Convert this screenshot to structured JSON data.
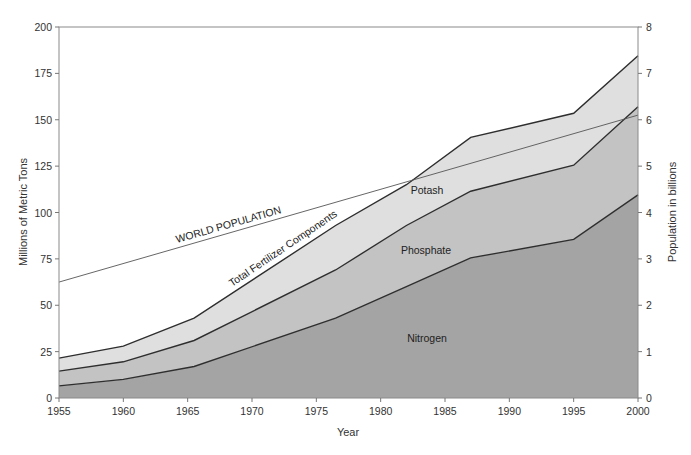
{
  "chart_data": {
    "type": "area",
    "stacked": true,
    "title": "",
    "xlabel": "Year",
    "ylabel": "Millions of Metric Tons",
    "ylabel_right": "Population in billions",
    "xlim": [
      1955,
      2000
    ],
    "ylim": [
      0,
      200
    ],
    "ylim_right": [
      0,
      8
    ],
    "grid": false,
    "legend": "none (inline annotations)",
    "x_ticks": [
      "1955",
      "1960",
      "1965",
      "1970",
      "1975",
      "1980",
      "1985",
      "1990",
      "1995",
      "2000"
    ],
    "y_ticks": [
      "0",
      "25",
      "50",
      "75",
      "100",
      "125",
      "150",
      "175",
      "200"
    ],
    "y_ticks_right": [
      "0",
      "1",
      "2",
      "3",
      "4",
      "5",
      "6",
      "7",
      "8"
    ],
    "x": [
      1955,
      1960,
      1965.5,
      1976.5,
      1982,
      1987,
      1995,
      2000
    ],
    "series": [
      {
        "name": "Nitrogen",
        "label": "Nitrogen",
        "color": "#a4a4a4",
        "values": [
          6.5,
          10,
          17,
          43,
          60,
          75.5,
          85.5,
          109.5
        ]
      },
      {
        "name": "Phosphate",
        "label": "Phosphate",
        "color": "#c3c3c3",
        "values": [
          8,
          9.5,
          14,
          26,
          33,
          36,
          40,
          47.5
        ]
      },
      {
        "name": "Potash",
        "label": "Potash",
        "color": "#dfdfdf",
        "values": [
          7,
          8.5,
          12,
          24,
          22,
          29,
          28,
          27.5
        ]
      }
    ],
    "cumulative_tops": {
      "nitrogen": [
        6.5,
        10,
        17,
        43,
        60,
        75.5,
        85.5,
        109.5
      ],
      "phosphate": [
        14.5,
        19.5,
        31,
        69,
        93,
        111.5,
        125.5,
        157
      ],
      "total": [
        21.5,
        28,
        43,
        93,
        115,
        140.5,
        153.5,
        184.5
      ]
    },
    "overlay_line": {
      "name": "World Population",
      "axis": "right",
      "units": "billions",
      "x": [
        1955,
        2000
      ],
      "values": [
        2.5,
        6.1
      ],
      "color": "#555555"
    },
    "annotations": [
      {
        "text": "WORLD POPULATION",
        "target": "population line"
      },
      {
        "text": "Total Fertilizer Components",
        "target": "total curve"
      },
      {
        "text": "Potash"
      },
      {
        "text": "Phosphate"
      },
      {
        "text": "Nitrogen"
      }
    ]
  },
  "labels": {
    "xlabel": "Year",
    "ylabel": "Millions of Metric Tons",
    "ylabel_right": "Population in billions",
    "world_population": "WORLD POPULATION",
    "total_fertilizer": "Total Fertilizer Components",
    "potash": "Potash",
    "phosphate": "Phosphate",
    "nitrogen": "Nitrogen"
  }
}
